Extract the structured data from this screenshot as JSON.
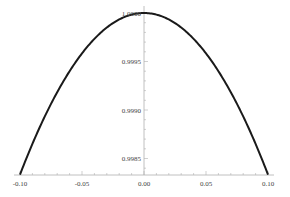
{
  "chart_data": {
    "type": "line",
    "title": "",
    "xlabel": "",
    "ylabel": "",
    "xlim": [
      -0.1,
      0.1
    ],
    "ylim": [
      0.99833,
      1.0
    ],
    "grid": false,
    "legend": null,
    "x_ticks": [
      "-0.10",
      "-0.05",
      "0.00",
      "0.05",
      "0.10"
    ],
    "y_ticks": [
      "0.9985",
      "0.9990",
      "0.9995",
      "1.0000"
    ],
    "series": [
      {
        "name": "sin(x)/x",
        "color": "#1a1a1a",
        "x": [
          -0.1,
          -0.09,
          -0.08,
          -0.07,
          -0.06,
          -0.05,
          -0.04,
          -0.03,
          -0.02,
          -0.01,
          0.0,
          0.01,
          0.02,
          0.03,
          0.04,
          0.05,
          0.06,
          0.07,
          0.08,
          0.09,
          0.1
        ],
        "y": [
          0.998334,
          0.99865,
          0.998934,
          0.999183,
          0.9994,
          0.999583,
          0.999733,
          0.99985,
          0.999933,
          0.999983,
          1.0,
          0.999983,
          0.999933,
          0.99985,
          0.999733,
          0.999583,
          0.9994,
          0.999183,
          0.998934,
          0.99865,
          0.998334
        ]
      }
    ]
  }
}
